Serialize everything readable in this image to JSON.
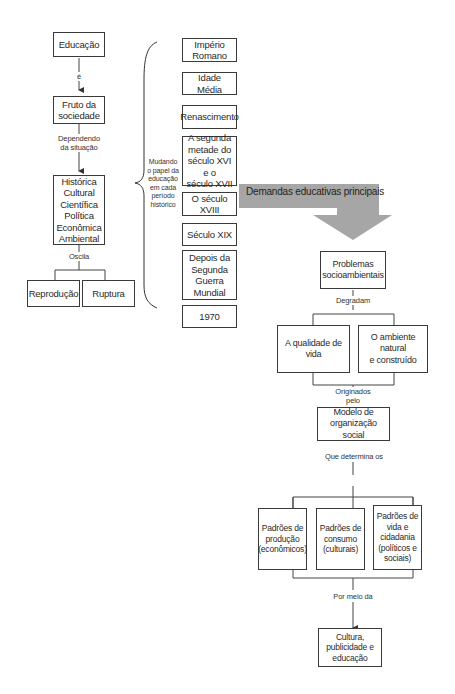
{
  "left_column": {
    "education": "Educação",
    "label_is": "é",
    "fruit": "Fruto da\nsociedade",
    "label_depending": "Dependendo\nda situação",
    "dimensions": "Histórica\nCultural\nCientífica\nPolítica\nEconômica\nAmbiental",
    "label_oscillates": "Oscila",
    "reproduction": "Reprodução",
    "rupture": "Ruptura"
  },
  "brace_label": "Mudando\no papel da\neducação\nem cada\nperíodo\nhistórico",
  "periods": [
    "Império\nRomano",
    "Idade Média",
    "Renascimento",
    "A segunda\nmetade do\nséculo XVI e o\nséculo XVII",
    "O século XVIII",
    "Século XIX",
    "Depois da\nSegunda\nGuerra\nMundial",
    "1970"
  ],
  "banner": {
    "label": "Demandas educativas principais",
    "color": "#a6a6a6"
  },
  "right_column": {
    "problems": "Problemas\nsocioambientais",
    "label_degrade": "Degradam",
    "quality_of_life": "A qualidade de vida",
    "environment": "O ambiente natural\ne construído",
    "label_originated": "Originados\npelo",
    "model": "Modelo de\norganização social",
    "label_determines": "Que determina os",
    "patterns": [
      "Padrões de\nprodução\n(econômicos)",
      "Padrões de\nconsumo\n(culturais)",
      "Padrões de\nvida e\ncidadania\n(políticos e\nsociais)"
    ],
    "label_through": "Por meio da",
    "culture": "Cultura,\npublicidade e\neducação"
  }
}
